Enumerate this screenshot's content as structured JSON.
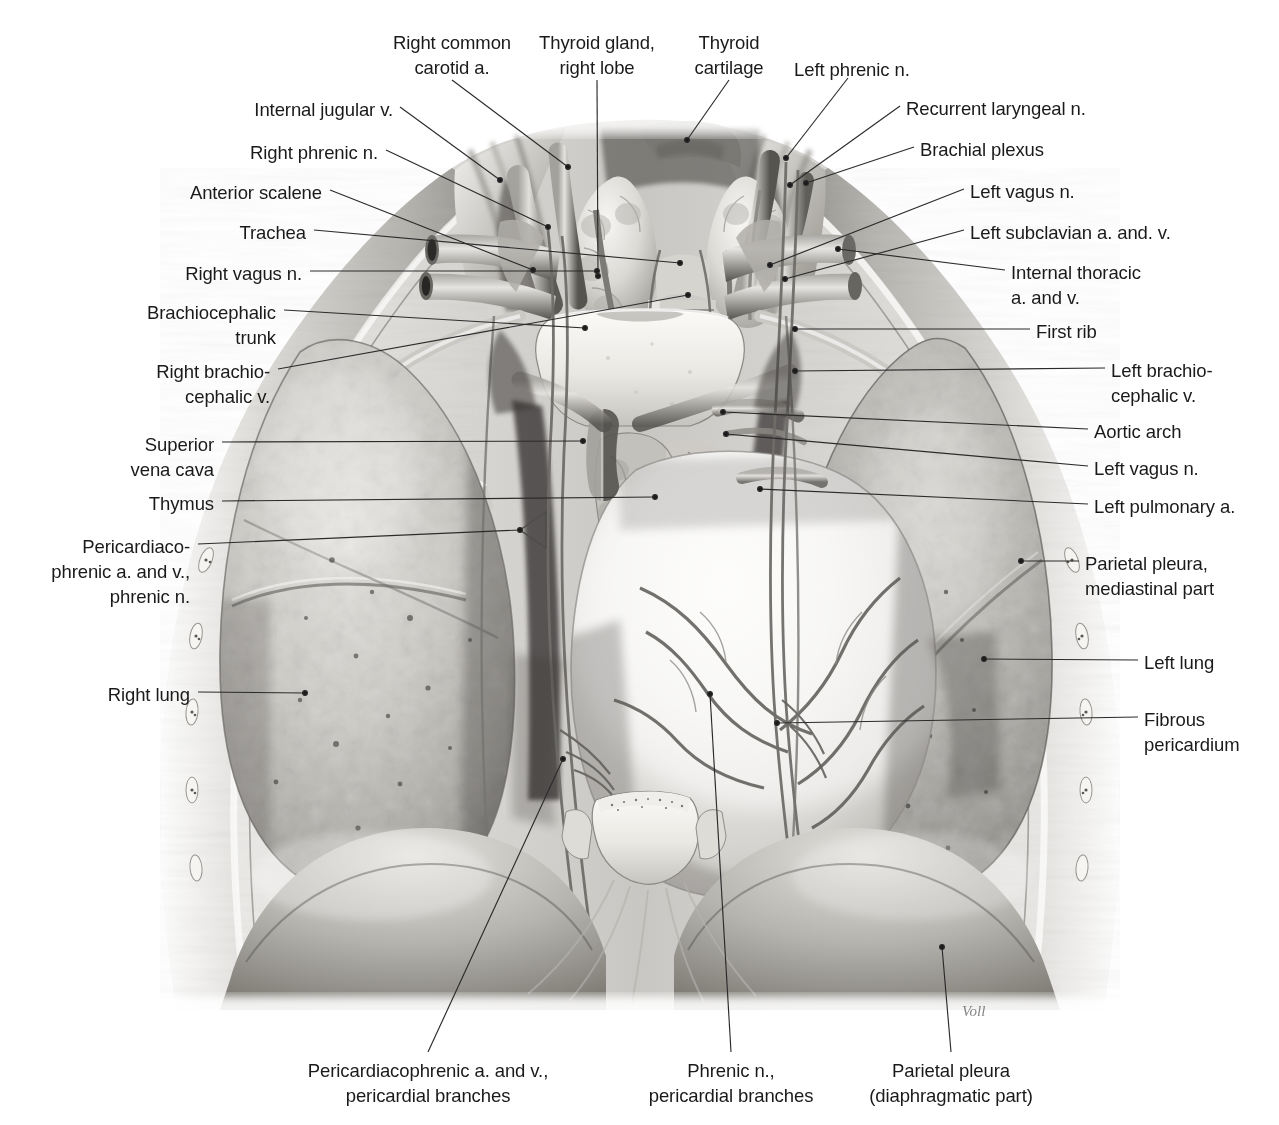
{
  "figure": {
    "signature": "Voll",
    "ink_color": "#1a1a1a",
    "leader_color": "#2b2b2b",
    "background": "#ffffff"
  },
  "labels": [
    {
      "id": "right-common-carotid",
      "text": "Right common\ncarotid a.",
      "align": "center",
      "x": 452,
      "y": 30,
      "anchor_x": 452,
      "anchor_y": 80,
      "tip_x": 568,
      "tip_y": 167
    },
    {
      "id": "thyroid-gland-right-lobe",
      "text": "Thyroid gland,\nright lobe",
      "align": "center",
      "x": 597,
      "y": 30,
      "anchor_x": 597,
      "anchor_y": 80,
      "tip_x": 598,
      "tip_y": 276
    },
    {
      "id": "thyroid-cartilage",
      "text": "Thyroid\ncartilage",
      "align": "center",
      "x": 729,
      "y": 30,
      "anchor_x": 729,
      "anchor_y": 80,
      "tip_x": 687,
      "tip_y": 140
    },
    {
      "id": "left-phrenic-n-top",
      "text": "Left phrenic n.",
      "align": "left",
      "x": 794,
      "y": 57,
      "anchor_x": 848,
      "anchor_y": 78,
      "tip_x": 786,
      "tip_y": 158
    },
    {
      "id": "internal-jugular-v",
      "text": "Internal jugular v.",
      "align": "right",
      "x": 393,
      "y": 97,
      "anchor_x": 400,
      "anchor_y": 107,
      "tip_x": 500,
      "tip_y": 180
    },
    {
      "id": "recurrent-laryngeal-n",
      "text": "Recurrent laryngeal n.",
      "align": "left",
      "x": 906,
      "y": 96,
      "anchor_x": 900,
      "anchor_y": 106,
      "tip_x": 790,
      "tip_y": 185
    },
    {
      "id": "right-phrenic-n",
      "text": "Right phrenic n.",
      "align": "right",
      "x": 378,
      "y": 140,
      "anchor_x": 386,
      "anchor_y": 150,
      "tip_x": 548,
      "tip_y": 227
    },
    {
      "id": "brachial-plexus",
      "text": "Brachial plexus",
      "align": "left",
      "x": 920,
      "y": 137,
      "anchor_x": 914,
      "anchor_y": 147,
      "tip_x": 806,
      "tip_y": 183
    },
    {
      "id": "anterior-scalene",
      "text": "Anterior scalene",
      "align": "right",
      "x": 322,
      "y": 180,
      "anchor_x": 330,
      "anchor_y": 190,
      "tip_x": 533,
      "tip_y": 270
    },
    {
      "id": "left-vagus-n-top",
      "text": "Left vagus n.",
      "align": "left",
      "x": 970,
      "y": 179,
      "anchor_x": 964,
      "anchor_y": 189,
      "tip_x": 770,
      "tip_y": 265
    },
    {
      "id": "trachea",
      "text": "Trachea",
      "align": "right",
      "x": 306,
      "y": 220,
      "anchor_x": 314,
      "anchor_y": 230,
      "tip_x": 680,
      "tip_y": 263
    },
    {
      "id": "left-subclavian-a-v",
      "text": "Left subclavian a. and. v.",
      "align": "left",
      "x": 970,
      "y": 220,
      "anchor_x": 964,
      "anchor_y": 230,
      "tip_x": 785,
      "tip_y": 279
    },
    {
      "id": "right-vagus-n",
      "text": "Right vagus n.",
      "align": "right",
      "x": 302,
      "y": 261,
      "anchor_x": 310,
      "anchor_y": 271,
      "tip_x": 597,
      "tip_y": 271
    },
    {
      "id": "internal-thoracic-a-v",
      "text": "Internal thoracic\na. and v.",
      "align": "left",
      "x": 1011,
      "y": 260,
      "anchor_x": 1005,
      "anchor_y": 270,
      "tip_x": 838,
      "tip_y": 249
    },
    {
      "id": "brachiocephalic-trunk",
      "text": "Brachiocephalic\ntrunk",
      "align": "right",
      "x": 276,
      "y": 300,
      "anchor_x": 284,
      "anchor_y": 310,
      "tip_x": 585,
      "tip_y": 328
    },
    {
      "id": "first-rib",
      "text": "First rib",
      "align": "left",
      "x": 1036,
      "y": 319,
      "anchor_x": 1030,
      "anchor_y": 329,
      "tip_x": 795,
      "tip_y": 329
    },
    {
      "id": "right-brachiocephalic-v",
      "text": "Right brachio-\ncephalic v.",
      "align": "right",
      "x": 270,
      "y": 359,
      "anchor_x": 278,
      "anchor_y": 369,
      "tip_x": 688,
      "tip_y": 295
    },
    {
      "id": "left-brachiocephalic-v",
      "text": "Left brachio-\ncephalic v.",
      "align": "left",
      "x": 1111,
      "y": 358,
      "anchor_x": 1105,
      "anchor_y": 368,
      "tip_x": 795,
      "tip_y": 371
    },
    {
      "id": "superior-vena-cava",
      "text": "Superior\nvena cava",
      "align": "right",
      "x": 214,
      "y": 432,
      "anchor_x": 222,
      "anchor_y": 442,
      "tip_x": 583,
      "tip_y": 441
    },
    {
      "id": "aortic-arch",
      "text": "Aortic arch",
      "align": "left",
      "x": 1094,
      "y": 419,
      "anchor_x": 1088,
      "anchor_y": 429,
      "tip_x": 723,
      "tip_y": 412
    },
    {
      "id": "left-vagus-n-mid",
      "text": "Left vagus n.",
      "align": "left",
      "x": 1094,
      "y": 456,
      "anchor_x": 1088,
      "anchor_y": 466,
      "tip_x": 726,
      "tip_y": 434
    },
    {
      "id": "thymus",
      "text": "Thymus",
      "align": "right",
      "x": 214,
      "y": 491,
      "anchor_x": 222,
      "anchor_y": 501,
      "tip_x": 655,
      "tip_y": 497
    },
    {
      "id": "left-pulmonary-a",
      "text": "Left pulmonary a.",
      "align": "left",
      "x": 1094,
      "y": 494,
      "anchor_x": 1088,
      "anchor_y": 504,
      "tip_x": 760,
      "tip_y": 489
    },
    {
      "id": "pericardiacophrenic-phrenic",
      "text": "Pericardiaco-\nphrenic a. and v.,\nphrenic n.",
      "align": "right",
      "x": 190,
      "y": 534,
      "anchor_x": 198,
      "anchor_y": 544,
      "tip_x": 520,
      "tip_y": 530
    },
    {
      "id": "parietal-pleura-mediastinal",
      "text": "Parietal pleura,\nmediastinal part",
      "align": "left",
      "x": 1085,
      "y": 551,
      "anchor_x": 1079,
      "anchor_y": 561,
      "tip_x": 1021,
      "tip_y": 561
    },
    {
      "id": "left-lung",
      "text": "Left lung",
      "align": "left",
      "x": 1144,
      "y": 650,
      "anchor_x": 1138,
      "anchor_y": 660,
      "tip_x": 984,
      "tip_y": 659
    },
    {
      "id": "right-lung",
      "text": "Right lung",
      "align": "right",
      "x": 190,
      "y": 682,
      "anchor_x": 198,
      "anchor_y": 692,
      "tip_x": 305,
      "tip_y": 693
    },
    {
      "id": "fibrous-pericardium",
      "text": "Fibrous\npericardium",
      "align": "left",
      "x": 1144,
      "y": 707,
      "anchor_x": 1138,
      "anchor_y": 717,
      "tip_x": 777,
      "tip_y": 723
    },
    {
      "id": "pericardiacophrenic-branches",
      "text": "Pericardiacophrenic a. and v.,\npericardial branches",
      "align": "center",
      "x": 428,
      "y": 1058,
      "anchor_x": 428,
      "anchor_y": 1052,
      "tip_x": 563,
      "tip_y": 759
    },
    {
      "id": "phrenic-n-pericardial",
      "text": "Phrenic n.,\npericardial branches",
      "align": "center",
      "x": 731,
      "y": 1058,
      "anchor_x": 731,
      "anchor_y": 1052,
      "tip_x": 710,
      "tip_y": 694
    },
    {
      "id": "parietal-pleura-diaphragm",
      "text": "Parietal pleura\n(diaphragmatic part)",
      "align": "center",
      "x": 951,
      "y": 1058,
      "anchor_x": 951,
      "anchor_y": 1052,
      "tip_x": 942,
      "tip_y": 947
    }
  ]
}
